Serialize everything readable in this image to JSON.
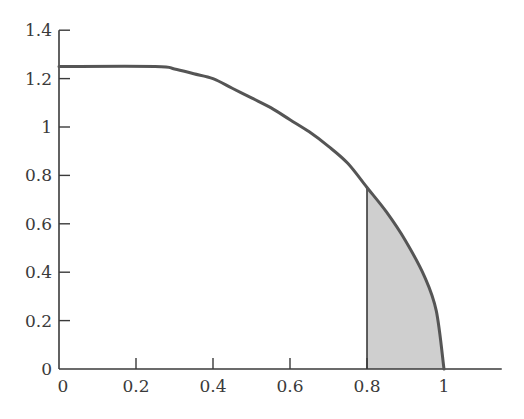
{
  "chart_data": {
    "type": "area",
    "title": "",
    "xlabel": "",
    "ylabel": "",
    "xlim": [
      0,
      1.15
    ],
    "ylim": [
      0,
      1.4
    ],
    "grid": false,
    "legend": null,
    "x_ticks": [
      0,
      0.2,
      0.4,
      0.6,
      0.8,
      1
    ],
    "x_tick_labels": [
      "0",
      "0.2",
      "0.4",
      "0.6",
      "0.8",
      "1"
    ],
    "y_ticks": [
      0,
      0.2,
      0.4,
      0.6,
      0.8,
      1,
      1.2,
      1.4
    ],
    "y_tick_labels": [
      "0",
      "0.2",
      "0.4",
      "0.6",
      "0.8",
      "1",
      "1.2",
      "1.4"
    ],
    "series": [
      {
        "name": "curve",
        "x": [
          0,
          0.25,
          0.3,
          0.35,
          0.4,
          0.45,
          0.5,
          0.55,
          0.6,
          0.65,
          0.7,
          0.75,
          0.8,
          0.85,
          0.9,
          0.95,
          0.98,
          1.0
        ],
        "y": [
          1.25,
          1.25,
          1.24,
          1.22,
          1.2,
          1.16,
          1.12,
          1.08,
          1.03,
          0.98,
          0.92,
          0.85,
          0.75,
          0.65,
          0.53,
          0.38,
          0.24,
          0
        ]
      }
    ],
    "shaded_region": {
      "x_from": 0.8,
      "x_to": 1.0,
      "color": "#cfcfcf",
      "description": "area under curve between x=0.8 and x=1"
    }
  },
  "colors": {
    "axis": "#3a3a3a",
    "curve": "#555555",
    "shade": "#cfcfcf"
  }
}
